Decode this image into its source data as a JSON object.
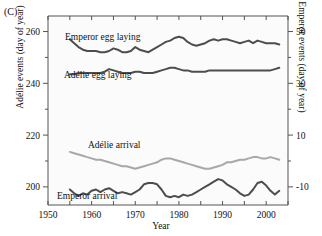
{
  "figure": {
    "panel_label": "(C)",
    "xlabel": "Year",
    "ylabel_left": "Adélie events (day of year)",
    "ylabel_right": "Emperor events (day of year)"
  },
  "labels": {
    "emperor_egg": "Emperor egg laying",
    "adelie_egg": "Adélie egg laying",
    "adelie_arrival": "Adélie arrival",
    "emperor_arrival": "Emperor arrival"
  },
  "ticks": {
    "x": [
      "1950",
      "1960",
      "1970",
      "1980",
      "1990",
      "2000"
    ],
    "y_left": [
      "200",
      "220",
      "240",
      "260"
    ],
    "y_right": [
      "-10",
      "10",
      "30",
      "50"
    ]
  },
  "colors": {
    "emperor": "#4d4d4d",
    "adelie": "#a8a8a8",
    "axis": "#555555",
    "plot_bg": "#fbfbfb"
  },
  "chart_data": {
    "type": "line",
    "title": "",
    "xlabel": "Year",
    "ylabel": "Adélie events (day of year)",
    "ylabel_secondary": "Emperor events (day of year)",
    "xlim": [
      1950,
      2005
    ],
    "ylim_left": [
      193,
      266
    ],
    "ylim_right": [
      -17,
      56
    ],
    "grid": false,
    "legend": "inline-annotations",
    "x": [
      1955,
      1956,
      1957,
      1958,
      1959,
      1960,
      1961,
      1962,
      1963,
      1964,
      1965,
      1966,
      1967,
      1968,
      1969,
      1970,
      1971,
      1972,
      1973,
      1974,
      1975,
      1976,
      1977,
      1978,
      1979,
      1980,
      1981,
      1982,
      1983,
      1984,
      1985,
      1986,
      1987,
      1988,
      1989,
      1990,
      1991,
      1992,
      1993,
      1994,
      1995,
      1996,
      1997,
      1998,
      1999,
      2000,
      2001,
      2002,
      2003
    ],
    "series": [
      {
        "name": "Emperor egg laying",
        "axis": "right",
        "color": "#4d4d4d",
        "unit": "day of year",
        "values": [
          47.0,
          45.5,
          44.0,
          43.0,
          42.5,
          42.5,
          42.5,
          42.0,
          42.0,
          42.5,
          43.5,
          43.0,
          42.0,
          42.0,
          42.5,
          44.0,
          43.0,
          42.5,
          42.0,
          43.0,
          44.0,
          45.0,
          46.0,
          46.5,
          47.5,
          48.0,
          47.5,
          46.0,
          45.0,
          44.5,
          45.0,
          45.5,
          46.5,
          47.0,
          46.5,
          47.0,
          47.0,
          46.5,
          46.0,
          45.5,
          46.0,
          46.5,
          45.5,
          46.5,
          46.0,
          45.5,
          45.5,
          45.5,
          45.0
        ]
      },
      {
        "name": "Adélie egg laying",
        "axis": "left",
        "color": "#4d4d4d",
        "unit": "day of year",
        "values": [
          243.5,
          243.5,
          244.0,
          244.0,
          244.0,
          244.0,
          244.0,
          244.0,
          244.5,
          245.5,
          245.0,
          244.5,
          244.0,
          244.0,
          244.0,
          244.5,
          244.5,
          244.0,
          244.0,
          244.0,
          244.5,
          245.0,
          245.5,
          246.0,
          246.0,
          245.5,
          245.0,
          245.0,
          244.5,
          244.5,
          244.5,
          244.5,
          245.0,
          245.0,
          245.0,
          245.0,
          245.0,
          245.0,
          245.0,
          245.0,
          245.0,
          245.0,
          245.0,
          245.0,
          245.0,
          245.0,
          245.0,
          245.5,
          246.0
        ]
      },
      {
        "name": "Adélie arrival",
        "axis": "left",
        "color": "#a8a8a8",
        "unit": "day of year",
        "values": [
          213.5,
          213.0,
          212.5,
          212.0,
          211.5,
          211.0,
          210.5,
          210.5,
          210.0,
          209.5,
          209.0,
          208.5,
          208.0,
          208.0,
          207.5,
          207.0,
          207.5,
          208.0,
          208.5,
          209.0,
          209.5,
          210.5,
          211.0,
          211.0,
          210.5,
          210.0,
          209.5,
          209.0,
          208.5,
          208.0,
          207.5,
          207.0,
          207.0,
          207.5,
          208.0,
          208.5,
          209.5,
          209.5,
          210.0,
          210.5,
          210.5,
          211.0,
          211.5,
          211.5,
          211.0,
          211.0,
          211.5,
          211.0,
          210.5
        ]
      },
      {
        "name": "Emperor arrival",
        "axis": "right",
        "color": "#4d4d4d",
        "unit": "day of year",
        "values": [
          -11.0,
          -12.5,
          -13.5,
          -12.5,
          -13.0,
          -11.5,
          -11.0,
          -12.0,
          -11.0,
          -10.5,
          -11.5,
          -12.5,
          -12.0,
          -12.5,
          -13.0,
          -12.0,
          -11.0,
          -9.0,
          -8.5,
          -8.5,
          -9.0,
          -11.0,
          -13.5,
          -14.0,
          -13.5,
          -14.0,
          -13.0,
          -13.5,
          -13.0,
          -12.0,
          -11.0,
          -10.0,
          -9.0,
          -8.0,
          -7.0,
          -7.5,
          -9.0,
          -10.0,
          -11.0,
          -12.5,
          -13.5,
          -13.0,
          -11.0,
          -8.5,
          -8.0,
          -9.5,
          -11.5,
          -13.0,
          -11.5
        ]
      }
    ]
  }
}
